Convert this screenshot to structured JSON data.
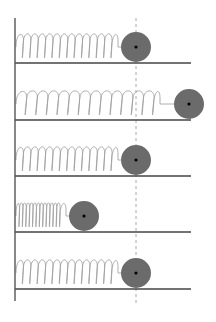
{
  "diagram": {
    "title": "",
    "colors": {
      "background": "#ffffff",
      "wall": "#555555",
      "floor": "#444444",
      "spring": "#9a9a9a",
      "mass": "#6b6b6b",
      "mass_center": "#000000",
      "equilibrium_line": "#aaaaaa"
    },
    "wall": {
      "x": 15,
      "y1": 18,
      "y2": 301
    },
    "equilibrium": {
      "x": 136,
      "y1": 18,
      "y2": 304,
      "dashed": true
    },
    "mass_radius": 15,
    "rows": [
      {
        "label": "equilibrium",
        "floor_y": 63,
        "mass_x": 136,
        "loops": 13,
        "coil_end": 118
      },
      {
        "label": "max-stretch",
        "floor_y": 120,
        "mass_x": 189,
        "loops": 13,
        "coil_end": 160
      },
      {
        "label": "equilibrium",
        "floor_y": 176,
        "mass_x": 136,
        "loops": 13,
        "coil_end": 118
      },
      {
        "label": "max-compression",
        "floor_y": 232,
        "mass_x": 84,
        "loops": 13,
        "coil_end": 66
      },
      {
        "label": "equilibrium",
        "floor_y": 289,
        "mass_x": 136,
        "loops": 13,
        "coil_end": 118
      }
    ],
    "floor_x_end": 191
  }
}
